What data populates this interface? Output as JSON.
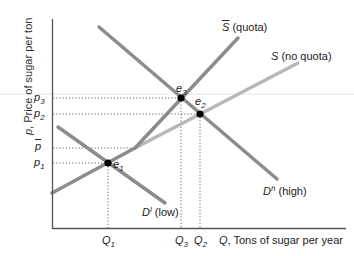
{
  "diagram": {
    "type": "supply-demand",
    "axes": {
      "y_label_var": "p",
      "y_label_text": ", Price of sugar per ton",
      "x_label_var": "Q",
      "x_label_text": ", Tons of sugar per year"
    },
    "price_ticks": [
      {
        "id": "p3",
        "base": "p",
        "sub": "3",
        "y": 98
      },
      {
        "id": "p2",
        "base": "p",
        "sub": "2",
        "y": 114
      },
      {
        "id": "pbar",
        "base": "p",
        "sub": "",
        "bar": true,
        "y": 148
      },
      {
        "id": "p1",
        "base": "p",
        "sub": "1",
        "y": 163
      }
    ],
    "quantity_ticks": [
      {
        "id": "Q1",
        "base": "Q",
        "sub": "1",
        "x": 108
      },
      {
        "id": "Q3",
        "base": "Q",
        "sub": "3",
        "x": 181
      },
      {
        "id": "Q2",
        "base": "Q",
        "sub": "2",
        "x": 200
      }
    ],
    "curves": [
      {
        "id": "D_high",
        "label_base": "D",
        "label_sup": "h",
        "label_text": " (high)",
        "color": "#8c8c8c"
      },
      {
        "id": "D_low",
        "label_base": "D",
        "label_sup": "l",
        "label_text": " (low)",
        "color": "#8c8c8c"
      },
      {
        "id": "S_quota",
        "label_base": "S",
        "label_bar": true,
        "label_text": " (quota)",
        "color": "#8c8c8c"
      },
      {
        "id": "S_no_quota",
        "label_base": "S",
        "label_text": " (no quota)",
        "color": "#b8b8b8"
      }
    ],
    "equilibria": [
      {
        "id": "e1",
        "base": "e",
        "sub": "1",
        "x": 108,
        "y": 163
      },
      {
        "id": "e2",
        "base": "e",
        "sub": "2",
        "x": 200,
        "y": 114
      },
      {
        "id": "e3",
        "base": "e",
        "sub": "3",
        "x": 181,
        "y": 98
      }
    ],
    "colors": {
      "axis": "#555555",
      "curve": "#8c8c8c",
      "curve_light": "#b8b8b8",
      "dot": "#000000",
      "guide": "#666666"
    }
  },
  "labels": {
    "p": "p",
    "Q": "Q",
    "D": "D",
    "S": "S",
    "e": "e",
    "sub1": "1",
    "sub2": "2",
    "sub3": "3",
    "sup_h": "h",
    "sup_l": "l",
    "high": " (high)",
    "low": " (low)",
    "quota": " (quota)",
    "no_quota": " (no quota)",
    "y_axis_text": ", Price of sugar per ton",
    "x_axis_text": ", Tons of sugar per year"
  }
}
